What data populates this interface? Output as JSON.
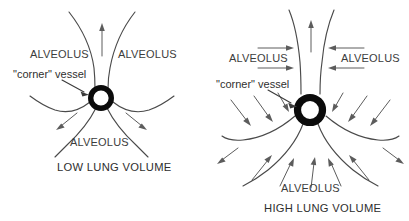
{
  "figure": {
    "background_color": "#ffffff",
    "text_color": "#3c3c3c",
    "vessel_color": "#0b0b0b",
    "wall_color": "#4a4a4a",
    "arrow_color": "#5c5c5c",
    "width": 409,
    "height": 221
  },
  "panels": [
    {
      "id": "low-lung-volume",
      "caption": "LOW LUNG VOLUME",
      "corner_vessel_label": "\"corner\" vessel",
      "alveolus_top_left": "ALVEOLUS",
      "alveolus_top_right": "ALVEOLUS",
      "alveolus_bottom": "ALVEOLUS",
      "vessel": {
        "cx": 101,
        "cy": 98,
        "outer_r": 13,
        "inner_r": 7.6
      },
      "arrow_count": 3,
      "arrow_direction": "outward",
      "description": "Three alveolar walls meet at the corner vessel; walls are slack and curved, vessel lumen is small and round."
    },
    {
      "id": "high-lung-volume",
      "caption": "HIGH LUNG VOLUME",
      "corner_vessel_label": "\"corner\" vessel",
      "alveolus_top_left": "ALVEOLUS",
      "alveolus_top_right": "ALVEOLUS",
      "alveolus_bottom": "ALVEOLUS",
      "vessel": {
        "cx": 310,
        "cy": 110,
        "outer_r": 16.5,
        "inner_r": 8.6
      },
      "arrow_count": 16,
      "arrow_direction": "inward",
      "description": "Alveolar walls are stretched and taut; many arrows point inward toward the corner vessel, expanding its lumen."
    }
  ]
}
